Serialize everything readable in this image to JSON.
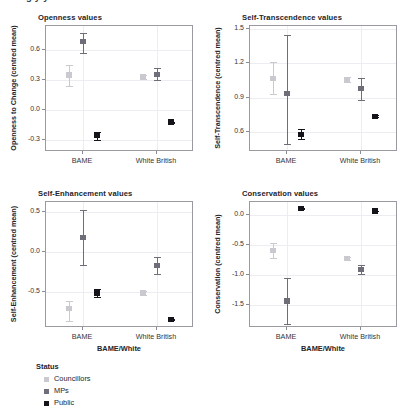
{
  "top_cut_text": "g                               y                 y",
  "legend": {
    "title": "Status",
    "items": [
      {
        "label": "Councillors",
        "color": "#c9c9cf"
      },
      {
        "label": "MPs",
        "color": "#6e6e79"
      },
      {
        "label": "Public",
        "color": "#14141a"
      }
    ]
  },
  "chart_data": [
    {
      "type": "scatter",
      "title": "Openness values",
      "xlabel": "",
      "ylabel": "Openness to Change (centred mean)",
      "categories": [
        "BAME",
        "White British"
      ],
      "yticks": [
        "0.6",
        "0.3",
        "0.0",
        "-0.3"
      ],
      "ytickvals": [
        0.6,
        0.3,
        0.0,
        -0.3
      ],
      "ylim": [
        -0.42,
        0.84
      ],
      "grid": true,
      "series": [
        {
          "name": "Councillors",
          "color": "#c9c9cf",
          "values": [
            0.35,
            0.335
          ],
          "err_low": [
            0.245,
            0.315
          ],
          "err_high": [
            0.455,
            0.355
          ]
        },
        {
          "name": "MPs",
          "color": "#6e6e79",
          "values": [
            0.685,
            0.355
          ],
          "err_low": [
            0.575,
            0.305
          ],
          "err_high": [
            0.775,
            0.425
          ]
        },
        {
          "name": "Public",
          "color": "#14141a",
          "values": [
            -0.255,
            -0.12
          ],
          "err_low": [
            -0.295,
            -0.125
          ],
          "err_high": [
            -0.215,
            -0.115
          ]
        }
      ]
    },
    {
      "type": "scatter",
      "title": "Self-Transcendence values",
      "xlabel": "",
      "ylabel": "Self-Transcendence (centred mean)",
      "categories": [
        "BAME",
        "White British"
      ],
      "yticks": [
        "1.5",
        "1.2",
        "0.9",
        "0.6"
      ],
      "ytickvals": [
        1.5,
        1.2,
        0.9,
        0.6
      ],
      "ylim": [
        0.42,
        1.53
      ],
      "grid": true,
      "series": [
        {
          "name": "Councillors",
          "color": "#c9c9cf",
          "values": [
            1.07,
            1.06
          ],
          "err_low": [
            0.93,
            1.035
          ],
          "err_high": [
            1.21,
            1.085
          ]
        },
        {
          "name": "MPs",
          "color": "#6e6e79",
          "values": [
            0.935,
            0.98
          ],
          "err_low": [
            0.49,
            0.875
          ],
          "err_high": [
            1.45,
            1.075
          ]
        },
        {
          "name": "Public",
          "color": "#14141a",
          "values": [
            0.575,
            0.735
          ],
          "err_low": [
            0.535,
            0.728
          ],
          "err_high": [
            0.625,
            0.742
          ]
        }
      ]
    },
    {
      "type": "scatter",
      "title": "Self-Enhancement values",
      "xlabel": "BAME/White",
      "ylabel": "Self-Enhancement (centred mean)",
      "categories": [
        "BAME",
        "White British"
      ],
      "yticks": [
        "0.5",
        "0.0",
        "-0.5"
      ],
      "ytickvals": [
        0.5,
        0.0,
        -0.5
      ],
      "ylim": [
        -0.95,
        0.62
      ],
      "grid": true,
      "series": [
        {
          "name": "Councillors",
          "color": "#c9c9cf",
          "values": [
            -0.71,
            -0.51
          ],
          "err_low": [
            -0.86,
            -0.535
          ],
          "err_high": [
            -0.61,
            -0.485
          ]
        },
        {
          "name": "MPs",
          "color": "#6e6e79",
          "values": [
            0.18,
            -0.17
          ],
          "err_low": [
            -0.17,
            -0.275
          ],
          "err_high": [
            0.52,
            -0.065
          ]
        },
        {
          "name": "Public",
          "color": "#14141a",
          "values": [
            -0.515,
            -0.845
          ],
          "err_low": [
            -0.565,
            -0.852
          ],
          "err_high": [
            -0.465,
            -0.838
          ]
        }
      ]
    },
    {
      "type": "scatter",
      "title": "Conservation values",
      "xlabel": "BAME/White",
      "ylabel": "Conservation (centred mean)",
      "categories": [
        "BAME",
        "White British"
      ],
      "yticks": [
        "0.0",
        "-0.5",
        "-1.0",
        "-1.5"
      ],
      "ytickvals": [
        0.0,
        -0.5,
        -1.0,
        -1.5
      ],
      "ylim": [
        -1.88,
        0.22
      ],
      "grid": true,
      "series": [
        {
          "name": "Councillors",
          "color": "#c9c9cf",
          "values": [
            -0.59,
            -0.72
          ],
          "err_low": [
            -0.71,
            -0.742
          ],
          "err_high": [
            -0.47,
            -0.698
          ]
        },
        {
          "name": "MPs",
          "color": "#6e6e79",
          "values": [
            -1.43,
            -0.91
          ],
          "err_low": [
            -1.81,
            -0.985
          ],
          "err_high": [
            -1.05,
            -0.835
          ]
        },
        {
          "name": "Public",
          "color": "#14141a",
          "values": [
            0.11,
            0.07
          ],
          "err_low": [
            0.104,
            0.064
          ],
          "err_high": [
            0.116,
            0.076
          ]
        }
      ]
    }
  ]
}
